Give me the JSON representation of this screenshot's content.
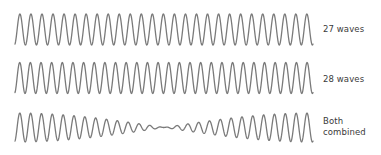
{
  "chart_data": {
    "type": "line",
    "title": "",
    "x_range": [
      0,
      1
    ],
    "series": [
      {
        "name": "27 waves",
        "cycles": 27,
        "amplitude": 1.0,
        "label_lines": [
          "27 waves"
        ]
      },
      {
        "name": "28 waves",
        "cycles": 28,
        "amplitude": 1.0,
        "label_lines": [
          "28 waves"
        ]
      },
      {
        "name": "Both combined",
        "components": [
          27,
          28
        ],
        "amplitude": 1.0,
        "label_lines": [
          "Both",
          "combined"
        ]
      }
    ],
    "grid": false,
    "legend": "labels at right of each wave",
    "colors": {
      "wave": "#7a7a7a",
      "text": "#3a3a3a"
    }
  },
  "labels": {
    "wave1": "27 waves",
    "wave2": "28 waves",
    "wave3_line1": "Both",
    "wave3_line2": "combined"
  }
}
